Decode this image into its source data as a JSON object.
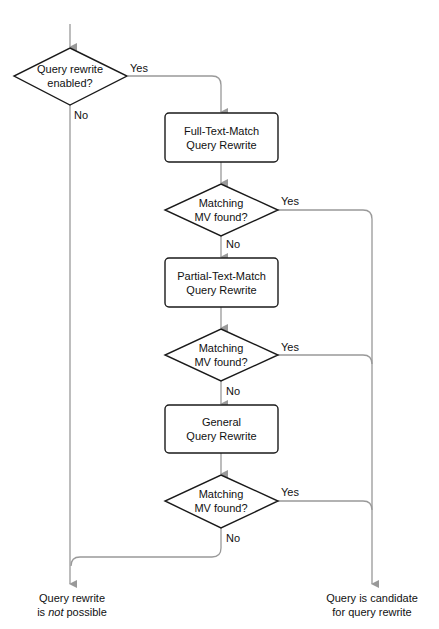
{
  "diagram": {
    "type": "flowchart",
    "colors": {
      "node_stroke": "#1a1a1a",
      "connector": "#999999",
      "background": "#ffffff",
      "text": "#111111"
    },
    "nodes": {
      "decision_enabled": {
        "line1": "Query rewrite",
        "line2": "enabled?"
      },
      "full_text_match": {
        "line1": "Full-Text-Match",
        "line2": "Query Rewrite"
      },
      "decision_1": {
        "line1": "Matching",
        "line2": "MV found?"
      },
      "partial_text_match": {
        "line1": "Partial-Text-Match",
        "line2": "Query Rewrite"
      },
      "decision_2": {
        "line1": "Matching",
        "line2": "MV found?"
      },
      "general": {
        "line1": "General",
        "line2": "Query Rewrite"
      },
      "decision_3": {
        "line1": "Matching",
        "line2": "MV found?"
      }
    },
    "terminals": {
      "not_possible": {
        "line1": "Query rewrite",
        "line2_pre": "is ",
        "line2_em": "not",
        "line2_post": " possible"
      },
      "candidate": {
        "line1": "Query is candidate",
        "line2": "for query rewrite"
      }
    },
    "edge_labels": {
      "enabled_yes": "Yes",
      "enabled_no": "No",
      "d1_yes": "Yes",
      "d1_no": "No",
      "d2_yes": "Yes",
      "d2_no": "No",
      "d3_yes": "Yes",
      "d3_no": "No"
    }
  }
}
